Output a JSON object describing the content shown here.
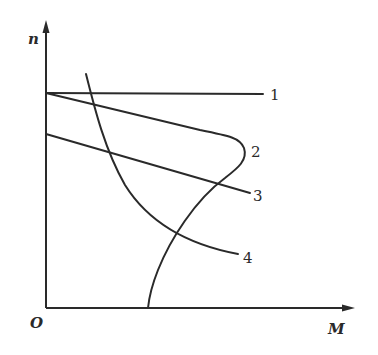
{
  "diagram": {
    "type": "mechanical-characteristic-curves",
    "axes": {
      "y_label": "n",
      "x_label": "M",
      "origin_label": "O"
    },
    "curves": [
      {
        "id": "1",
        "label": "1",
        "description": "horizontal line (absolutely hard characteristic)"
      },
      {
        "id": "2",
        "label": "2",
        "description": "S-shaped curve starting at n0, bulging right, ending on M axis"
      },
      {
        "id": "3",
        "label": "3",
        "description": "straight line sloping down from lower starting speed"
      },
      {
        "id": "4",
        "label": "4",
        "description": "soft hyperbolic-like curve falling steeply then flattening"
      }
    ],
    "colors": {
      "stroke": "#2a2a2a",
      "background": "#ffffff"
    }
  }
}
